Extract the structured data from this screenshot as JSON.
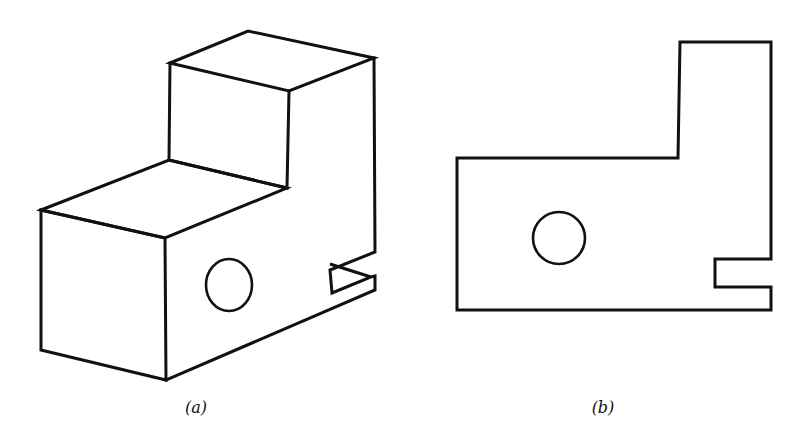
{
  "figure": {
    "panels": [
      {
        "id": "a",
        "caption": "(a)",
        "description": "Isometric (pictorial) view of stepped block with circular hole and slot"
      },
      {
        "id": "b",
        "caption": "(b)",
        "description": "Orthographic front view showing outline, circular hole and slot"
      }
    ],
    "colors": {
      "line": "#111111",
      "background": "#ffffff"
    }
  }
}
